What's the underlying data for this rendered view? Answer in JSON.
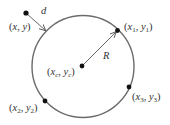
{
  "diagram": {
    "title": "",
    "colors": {
      "circle": "#6b6b6b",
      "point": "#111111",
      "arrow": "#555555",
      "text": "#333333",
      "background": "#ffffff"
    },
    "circle": {
      "cx": 83,
      "cy": 66.5,
      "r": 51
    },
    "center": {
      "name": "center",
      "x": 82,
      "y": 66,
      "label": {
        "open": "(",
        "var1": "x",
        "sub1": "c",
        "sep": ", ",
        "var2": "y",
        "sub2": "c",
        "close": ")"
      }
    },
    "points": [
      {
        "name": "point-1",
        "x": 117.5,
        "y": 30.5,
        "label": {
          "open": "(",
          "var1": "x",
          "sub1": "1",
          "sep": ", ",
          "var2": "y",
          "sub2": "1",
          "close": ")"
        }
      },
      {
        "name": "point-2",
        "x": 45,
        "y": 101,
        "label": {
          "open": "(",
          "var1": "x",
          "sub1": "2",
          "sep": ", ",
          "var2": "y",
          "sub2": "2",
          "close": ")"
        }
      },
      {
        "name": "point-3",
        "x": 129,
        "y": 87,
        "label": {
          "open": "(",
          "var1": "x",
          "sub1": "3",
          "sep": ", ",
          "var2": "y",
          "sub2": "3",
          "close": ")"
        }
      }
    ],
    "external_point": {
      "x": 26,
      "y": 13,
      "label": {
        "open": "(",
        "var1": "x",
        "sep": ", ",
        "var2": "y",
        "close": ")"
      }
    },
    "distance": {
      "label": "d"
    },
    "radius": {
      "label": "R"
    }
  }
}
